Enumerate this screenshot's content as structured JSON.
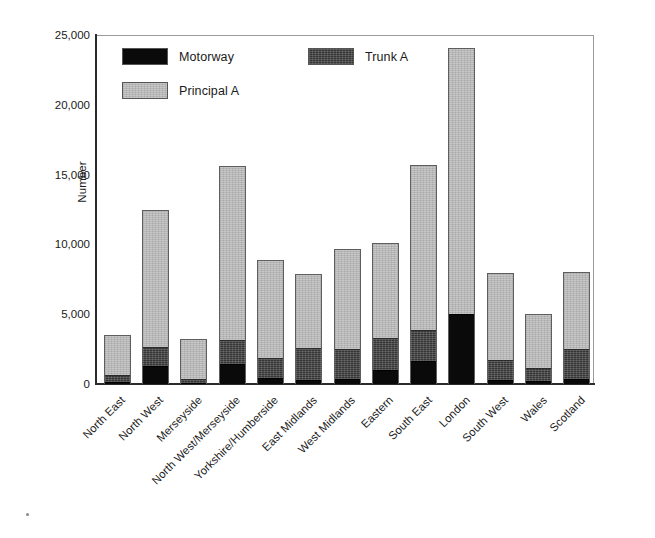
{
  "chart_data": {
    "type": "bar",
    "stacked": true,
    "title": "",
    "xlabel": "",
    "ylabel": "Number",
    "ylim": [
      0,
      25000
    ],
    "ytick_labels": [
      "25,000",
      "20,000",
      "15,000",
      "10,000",
      "5,000",
      "0"
    ],
    "ytick_values": [
      25000,
      20000,
      15000,
      10000,
      5000,
      0
    ],
    "grid": false,
    "legend_position": "inside-top-left",
    "categories": [
      "North East",
      "North West",
      "Merseyside",
      "North West/Merseyside",
      "Yorkshire/Humberside",
      "East Midlands",
      "West Midlands",
      "Eastern",
      "South East",
      "London",
      "South West",
      "Wales",
      "Scotland"
    ],
    "series": [
      {
        "name": "Motorway",
        "color": "#0a0a0a",
        "values": [
          150,
          1300,
          100,
          1450,
          450,
          300,
          350,
          1000,
          1650,
          5000,
          300,
          200,
          350
        ]
      },
      {
        "name": "Trunk A",
        "color": "#3b3b3b",
        "values": [
          500,
          1400,
          300,
          1750,
          1400,
          2300,
          2200,
          2350,
          2250,
          0,
          1450,
          950,
          2150
        ]
      },
      {
        "name": "Principal A",
        "color": "#b3b3b3",
        "values": [
          2850,
          9800,
          2850,
          12400,
          7050,
          5300,
          7150,
          6750,
          11800,
          19100,
          6200,
          3850,
          5500
        ]
      }
    ],
    "totals": [
      3500,
      12500,
      3250,
      15600,
      8900,
      7900,
      9700,
      10100,
      15700,
      24100,
      7950,
      5000,
      8000
    ]
  },
  "legend": {
    "items": [
      {
        "label": "Motorway",
        "swatch": "black-swatch"
      },
      {
        "label": "Trunk A",
        "swatch": "dark-gray-swatch"
      },
      {
        "label": "Principal A",
        "swatch": "light-gray-swatch"
      }
    ]
  }
}
